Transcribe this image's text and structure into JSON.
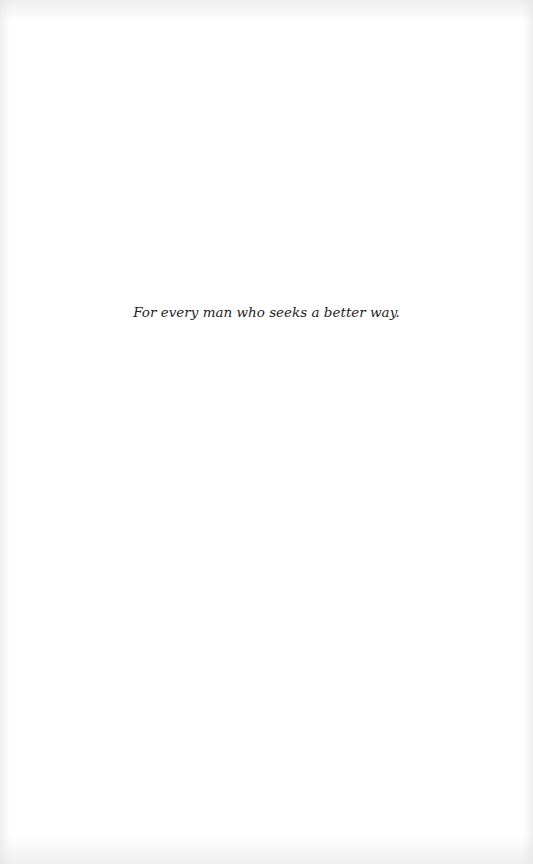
{
  "page": {
    "type": "dedication",
    "background_color": "#ffffff",
    "text_color": "#1e1e1e"
  },
  "dedication": {
    "text": "For every man who seeks a better way."
  }
}
